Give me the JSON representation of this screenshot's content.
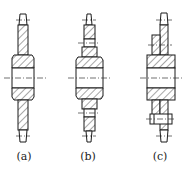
{
  "figure": {
    "type": "technical-drawing",
    "colors": {
      "line": "#1a1a1a",
      "background": "#ffffff"
    },
    "panels": [
      {
        "id": "a",
        "label": "(a)",
        "description": "single-piece sprocket"
      },
      {
        "id": "b",
        "label": "(b)",
        "description": "sprocket with stepped web"
      },
      {
        "id": "c",
        "label": "(c)",
        "description": "bolted ring sprocket on hub"
      }
    ]
  }
}
